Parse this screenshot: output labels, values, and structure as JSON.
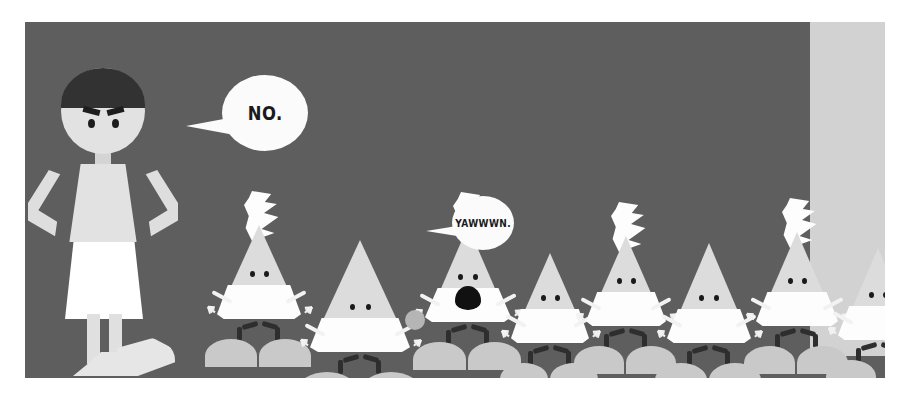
{
  "scene": {
    "title": "cartoon-panel-no-yawwwn",
    "background_color": "#5e5e5e",
    "border_color": "#ffffff",
    "panel": {
      "x": 25,
      "y": 22,
      "width": 860,
      "height": 356
    }
  },
  "doorway": {
    "label": "light-doorway",
    "color": "#d2d2d2",
    "x": 810,
    "y": 18,
    "width": 75,
    "height": 338
  },
  "speech_bubbles": [
    {
      "id": "bubble-no",
      "text": "NO.",
      "font_size": 20,
      "x": 222,
      "y": 75,
      "width": 86,
      "height": 76,
      "tail_direction": "left-down",
      "speaker": "standing-figure"
    },
    {
      "id": "bubble-yawwwn",
      "text": "YAWWWN.",
      "font_size": 11,
      "x": 452,
      "y": 196,
      "width": 62,
      "height": 54,
      "tail_direction": "left-down",
      "speaker": "cone-creature-3"
    }
  ],
  "figure": {
    "name": "standing-figure",
    "pose": "hands-on-hips",
    "hair_color": "#323232",
    "skin_color": "#e2e2e2",
    "skirt_color": "#ffffff",
    "expression": "angry",
    "head": {
      "x": 82,
      "y": 55,
      "size": 84
    }
  },
  "creatures": [
    {
      "id": "cone-creature-1",
      "x": 200,
      "y": 225,
      "cone_w": 78,
      "cone_h": 86,
      "crest": true,
      "mouth": false,
      "ball": false,
      "mounds": 2,
      "skirt_w": 84,
      "eye_gap": 14
    },
    {
      "id": "cone-creature-2",
      "x": 292,
      "y": 240,
      "cone_w": 96,
      "cone_h": 104,
      "crest": false,
      "mouth": false,
      "ball": false,
      "mounds": 2,
      "skirt_w": 100,
      "eye_gap": 16
    },
    {
      "id": "cone-creature-3",
      "x": 410,
      "y": 226,
      "cone_w": 76,
      "cone_h": 88,
      "crest": true,
      "mouth": true,
      "ball": true,
      "mounds": 2,
      "skirt_w": 86,
      "eye_gap": 15
    },
    {
      "id": "cone-creature-4",
      "x": 494,
      "y": 253,
      "cone_w": 72,
      "cone_h": 82,
      "crest": false,
      "mouth": false,
      "ball": false,
      "mounds": 2,
      "skirt_w": 78,
      "eye_gap": 14
    },
    {
      "id": "cone-creature-5",
      "x": 570,
      "y": 236,
      "cone_w": 72,
      "cone_h": 82,
      "crest": true,
      "mouth": false,
      "ball": false,
      "mounds": 2,
      "skirt_w": 80,
      "eye_gap": 14
    },
    {
      "id": "cone-creature-6",
      "x": 650,
      "y": 243,
      "cone_w": 78,
      "cone_h": 92,
      "crest": false,
      "mouth": false,
      "ball": false,
      "mounds": 2,
      "skirt_w": 84,
      "eye_gap": 15
    },
    {
      "id": "cone-creature-7",
      "x": 740,
      "y": 232,
      "cone_w": 74,
      "cone_h": 86,
      "crest": true,
      "mouth": false,
      "ball": false,
      "mounds": 2,
      "skirt_w": 82,
      "eye_gap": 14
    },
    {
      "id": "cone-creature-8",
      "x": 822,
      "y": 248,
      "cone_w": 72,
      "cone_h": 84,
      "crest": false,
      "mouth": false,
      "ball": false,
      "mounds": 1,
      "skirt_w": 80,
      "eye_gap": 14
    }
  ],
  "palette": {
    "background": "#5e5e5e",
    "cone_body": "#dcdcdc",
    "cone_skirt": "#fdfdfd",
    "mound": "#c9c9c9",
    "leg": "#2e2e2e",
    "eye": "#1a1a1a",
    "hair": "#323232",
    "doorway": "#d2d2d2",
    "bubble": "#fbfbfb"
  }
}
